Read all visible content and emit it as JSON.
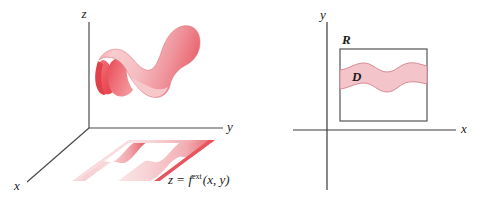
{
  "figure": {
    "background_color": "#ffffff",
    "left_panel": {
      "name": "3d-surface-panel",
      "axes": {
        "z_label": "z",
        "y_label": "y",
        "x_label": "x"
      },
      "surface_equation": {
        "lhs": "z",
        "equals": "=",
        "fn": "f",
        "superscript": "ext",
        "args": "(x, y)",
        "full_text": "z = f ext(x, y)"
      },
      "colors": {
        "surface_light": "#f7c3c6",
        "surface_mid": "#f09ca2",
        "surface_dark": "#e8565f",
        "plane_light": "#fbdfe1",
        "plane_dark": "#e8565f",
        "outline": "#e0737c"
      }
    },
    "right_panel": {
      "name": "2d-region-panel",
      "axes": {
        "y_label": "y",
        "x_label": "x"
      },
      "rectangle_label": "R",
      "region_label": "D",
      "colors": {
        "region_fill": "#f3c5ca",
        "region_stroke": "#d98a95",
        "rect_stroke": "#555555",
        "axis_stroke": "#3a3a3a"
      }
    }
  }
}
